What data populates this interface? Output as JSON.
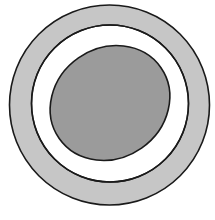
{
  "diagram": {
    "colors": {
      "background": "#ffffff",
      "outer_ring_fill": "#c6c6c6",
      "inner_circle_fill": "#ffffff",
      "ellipse_fill": "#9b9b9b",
      "stroke": "#1a1a1a"
    },
    "shapes": {
      "outer_circle": {
        "cx": 109.5,
        "cy": 105,
        "r": 100
      },
      "inner_circle": {
        "cx": 110,
        "cy": 103.5,
        "r": 78.5
      },
      "ellipse": {
        "cx": 110,
        "cy": 103,
        "rx": 62,
        "ry": 55,
        "rotate": -35
      }
    }
  }
}
